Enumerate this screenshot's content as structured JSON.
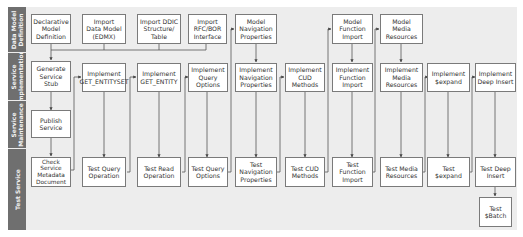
{
  "lanes": [
    {
      "id": "data-model",
      "label": "Data Model\nDefinition"
    },
    {
      "id": "service-implementation",
      "label": "Service\nImplementation"
    },
    {
      "id": "service-maintenance",
      "label": "Service\nMaintenance"
    },
    {
      "id": "test-service",
      "label": "Test Service"
    }
  ],
  "boxes": {
    "declarative_model": "Declarative\nModel\nDefinition",
    "import_data_model": "Import\nData Model\n(EDMX)",
    "import_ddic": "Import DDIC\nStructure/\nTable",
    "import_rfc": "Import\nRFC/BOR\nInterface",
    "model_navigation": "Model\nNavigation\nProperties",
    "model_function_import": "Model\nFunction\nImport",
    "model_media": "Model\nMedia\nResources",
    "generate_stub": "Generate\nService\nStub",
    "impl_get_entityset": "Implement\nGET_ENTITYSET",
    "impl_get_entity": "Implement\nGET_ENTITY",
    "impl_query_options": "Implement\nQuery\nOptions",
    "impl_navigation": "Implement\nNavigation\nProperties",
    "impl_cud": "Implement\nCUD\nMethods",
    "impl_function_import": "Implement\nFunction\nImport",
    "impl_media": "Implement\nMedia\nResources",
    "impl_expand": "Implement\n$expand",
    "impl_deep_insert": "Implement\nDeep Insert",
    "publish_service": "Publish\nService",
    "check_metadata": "Check\nService\nMetadata\nDocument",
    "test_query_operation": "Test Query\nOperation",
    "test_read_operation": "Test Read\nOperation",
    "test_query_options": "Test Query\nOptions",
    "test_navigation": "Test\nNavigation\nProperties",
    "test_cud": "Test CUD\nMethods",
    "test_function_import": "Test\nFunction\nImport",
    "test_media": "Test Media\nResources",
    "test_expand": "Test\n$expand",
    "test_deep_insert": "Test Deep\nInsert",
    "test_batch": "Test\n$Batch"
  },
  "colors": {
    "panel_bg": "#ededed",
    "lane_label_bg": "#6f6f6f",
    "box_border": "#7a7a7a",
    "line": "#555555"
  }
}
